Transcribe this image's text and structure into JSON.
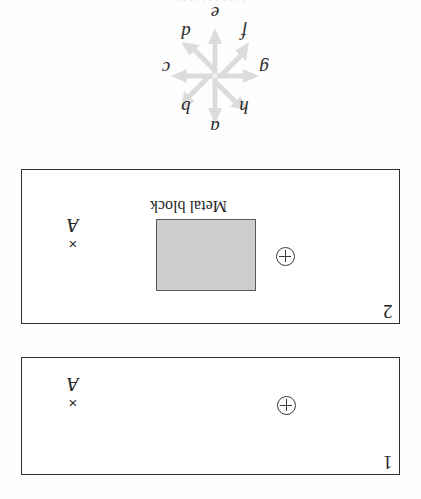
{
  "figure": {
    "orientation": "rotated-180",
    "top_cropped_text": "· · · · · · · · · · ·",
    "bottom_speckle_text": "· · · · · ·"
  },
  "compass_rose": {
    "name": "direction-compass-rose",
    "arrow_color": "#dcdcdc",
    "directions": [
      {
        "key": "top",
        "label": "e"
      },
      {
        "key": "topleft",
        "label": "d"
      },
      {
        "key": "topright",
        "label": "f"
      },
      {
        "key": "left",
        "label": "c"
      },
      {
        "key": "right",
        "label": "g"
      },
      {
        "key": "botleft",
        "label": "b"
      },
      {
        "key": "botright",
        "label": "h"
      },
      {
        "key": "bottom",
        "label": "a"
      }
    ]
  },
  "panels": [
    {
      "id": "panel-2",
      "number": "2",
      "point_label": "A",
      "point_mark": "×",
      "charge_symbol": "circled-plus",
      "has_metal_block": true,
      "metal_block_caption": "Metal block",
      "metal_block_fill": "#cdcdcd",
      "metal_block_border": "#5a5a5a"
    },
    {
      "id": "panel-1",
      "number": "1",
      "point_label": "A",
      "point_mark": "×",
      "charge_symbol": "circled-plus",
      "has_metal_block": false,
      "metal_block_caption": "",
      "metal_block_fill": "",
      "metal_block_border": ""
    }
  ],
  "colors": {
    "ink": "#2e2e2e",
    "paper": "#fefefe",
    "arrow_gray": "#dcdcdc",
    "block_gray": "#cdcdcd"
  }
}
